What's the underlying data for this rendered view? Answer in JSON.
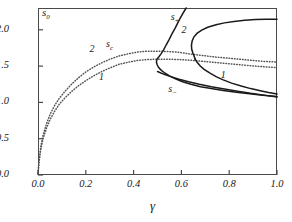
{
  "chart_data": {
    "type": "line",
    "title": "",
    "xlabel": "γ",
    "ylabel": "s",
    "ylabel_sub": "0",
    "xlim": [
      0.0,
      1.0
    ],
    "ylim": [
      0.0,
      2.3
    ],
    "grid": false,
    "legend": "none",
    "xticks": [
      "0.0",
      "0.2",
      "0.4",
      "0.6",
      "0.8",
      "1.0"
    ],
    "xtick_values": [
      0.0,
      0.2,
      0.4,
      0.6,
      0.8,
      1.0
    ],
    "yticks": [
      "0.0",
      "0.5",
      "1.0",
      "1.5",
      "2.0"
    ],
    "ytick_values": [
      0.0,
      0.5,
      1.0,
      1.5,
      2.0
    ],
    "annotations": [
      {
        "text": "s",
        "sub": "+",
        "x": 0.555,
        "y": 2.18
      },
      {
        "text": "2",
        "sub": "",
        "x": 0.6,
        "y": 2.0
      },
      {
        "text": "s",
        "sub": "c",
        "x": 0.285,
        "y": 1.81
      },
      {
        "text": "2",
        "sub": "",
        "x": 0.215,
        "y": 1.735
      },
      {
        "text": "1",
        "sub": "",
        "x": 0.255,
        "y": 1.345
      },
      {
        "text": "s",
        "sub": "−",
        "x": 0.545,
        "y": 1.185
      },
      {
        "text": "1",
        "sub": "",
        "x": 0.765,
        "y": 1.38
      }
    ],
    "series": [
      {
        "name": "s_c curve 2",
        "style": "dotted",
        "color": "#555555",
        "points": [
          [
            0.0,
            0.02
          ],
          [
            0.005,
            0.22
          ],
          [
            0.012,
            0.4
          ],
          [
            0.022,
            0.56
          ],
          [
            0.035,
            0.7
          ],
          [
            0.05,
            0.83
          ],
          [
            0.07,
            0.96
          ],
          [
            0.09,
            1.06
          ],
          [
            0.115,
            1.16
          ],
          [
            0.14,
            1.25
          ],
          [
            0.17,
            1.34
          ],
          [
            0.2,
            1.42
          ],
          [
            0.235,
            1.49
          ],
          [
            0.27,
            1.55
          ],
          [
            0.305,
            1.6
          ],
          [
            0.34,
            1.64
          ],
          [
            0.38,
            1.67
          ],
          [
            0.42,
            1.695
          ],
          [
            0.46,
            1.705
          ],
          [
            0.5,
            1.705
          ],
          [
            0.545,
            1.7
          ],
          [
            0.59,
            1.69
          ],
          [
            0.64,
            1.665
          ],
          [
            0.69,
            1.645
          ],
          [
            0.74,
            1.625
          ],
          [
            0.79,
            1.61
          ],
          [
            0.84,
            1.595
          ],
          [
            0.89,
            1.58
          ],
          [
            0.945,
            1.565
          ],
          [
            1.0,
            1.555
          ]
        ]
      },
      {
        "name": "s_c curve 1",
        "style": "dotted",
        "color": "#555555",
        "points": [
          [
            0.0,
            0.02
          ],
          [
            0.005,
            0.2
          ],
          [
            0.012,
            0.36
          ],
          [
            0.022,
            0.51
          ],
          [
            0.035,
            0.64
          ],
          [
            0.05,
            0.76
          ],
          [
            0.07,
            0.88
          ],
          [
            0.09,
            0.98
          ],
          [
            0.115,
            1.07
          ],
          [
            0.14,
            1.15
          ],
          [
            0.17,
            1.23
          ],
          [
            0.2,
            1.3
          ],
          [
            0.235,
            1.37
          ],
          [
            0.27,
            1.43
          ],
          [
            0.305,
            1.48
          ],
          [
            0.34,
            1.525
          ],
          [
            0.38,
            1.555
          ],
          [
            0.42,
            1.58
          ],
          [
            0.46,
            1.59
          ],
          [
            0.5,
            1.595
          ],
          [
            0.545,
            1.595
          ],
          [
            0.59,
            1.59
          ],
          [
            0.64,
            1.58
          ],
          [
            0.69,
            1.565
          ],
          [
            0.74,
            1.55
          ],
          [
            0.79,
            1.535
          ],
          [
            0.84,
            1.52
          ],
          [
            0.89,
            1.505
          ],
          [
            0.945,
            1.49
          ],
          [
            1.0,
            1.48
          ]
        ]
      },
      {
        "name": "solid branch 2 (s+ / s-)",
        "style": "solid",
        "color": "#1a1a1a",
        "points": [
          [
            0.62,
            2.3
          ],
          [
            0.605,
            2.22
          ],
          [
            0.59,
            2.13
          ],
          [
            0.575,
            2.03
          ],
          [
            0.56,
            1.94
          ],
          [
            0.548,
            1.86
          ],
          [
            0.536,
            1.79
          ],
          [
            0.525,
            1.72
          ],
          [
            0.514,
            1.665
          ],
          [
            0.505,
            1.625
          ],
          [
            0.499,
            1.6
          ],
          [
            0.496,
            1.575
          ],
          [
            0.496,
            1.545
          ],
          [
            0.499,
            1.515
          ],
          [
            0.505,
            1.48
          ],
          [
            0.515,
            1.445
          ],
          [
            0.53,
            1.405
          ],
          [
            0.55,
            1.365
          ],
          [
            0.575,
            1.325
          ],
          [
            0.605,
            1.285
          ],
          [
            0.64,
            1.25
          ],
          [
            0.68,
            1.215
          ],
          [
            0.725,
            1.19
          ],
          [
            0.775,
            1.165
          ],
          [
            0.83,
            1.14
          ],
          [
            0.885,
            1.12
          ],
          [
            0.94,
            1.1
          ],
          [
            1.0,
            1.08
          ]
        ]
      },
      {
        "name": "solid branch 1 upper",
        "style": "solid",
        "color": "#1a1a1a",
        "points": [
          [
            1.0,
            2.145
          ],
          [
            0.955,
            2.145
          ],
          [
            0.91,
            2.14
          ],
          [
            0.865,
            2.13
          ],
          [
            0.82,
            2.115
          ],
          [
            0.78,
            2.095
          ],
          [
            0.745,
            2.07
          ],
          [
            0.71,
            2.035
          ],
          [
            0.685,
            1.995
          ],
          [
            0.665,
            1.95
          ],
          [
            0.652,
            1.9
          ],
          [
            0.645,
            1.845
          ],
          [
            0.642,
            1.79
          ],
          [
            0.643,
            1.735
          ],
          [
            0.648,
            1.68
          ],
          [
            0.653,
            1.64
          ],
          [
            0.657,
            1.6
          ]
        ]
      },
      {
        "name": "solid branch 1 lower",
        "style": "solid",
        "color": "#1a1a1a",
        "points": [
          [
            0.657,
            1.6
          ],
          [
            0.665,
            1.555
          ],
          [
            0.678,
            1.505
          ],
          [
            0.695,
            1.455
          ],
          [
            0.718,
            1.405
          ],
          [
            0.745,
            1.355
          ],
          [
            0.775,
            1.31
          ],
          [
            0.81,
            1.265
          ],
          [
            0.85,
            1.225
          ],
          [
            0.89,
            1.19
          ],
          [
            0.93,
            1.16
          ],
          [
            0.965,
            1.135
          ],
          [
            1.0,
            1.115
          ]
        ]
      },
      {
        "name": "solid lower tail",
        "style": "solid",
        "color": "#1a1a1a",
        "points": [
          [
            0.5,
            1.425
          ],
          [
            0.525,
            1.39
          ],
          [
            0.555,
            1.355
          ],
          [
            0.59,
            1.32
          ],
          [
            0.63,
            1.285
          ],
          [
            0.675,
            1.25
          ],
          [
            0.725,
            1.215
          ],
          [
            0.78,
            1.185
          ],
          [
            0.835,
            1.155
          ],
          [
            0.89,
            1.125
          ],
          [
            0.945,
            1.1
          ],
          [
            1.0,
            1.075
          ]
        ]
      }
    ]
  }
}
